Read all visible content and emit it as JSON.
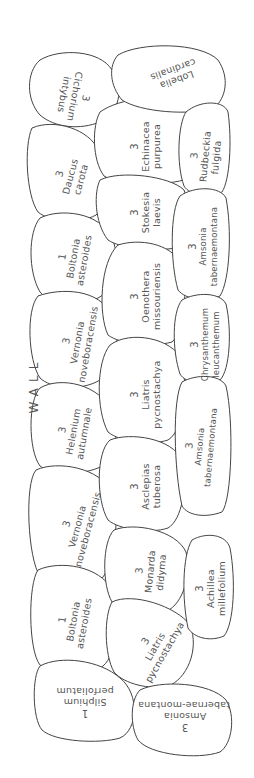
{
  "wall_label": "WALL",
  "beds": [
    {
      "id": "cichorium",
      "qty": "3",
      "name": "Cichorium",
      "name2": "intybus"
    },
    {
      "id": "lobelia",
      "qty": "",
      "name": "Lobelia",
      "name2": "cardinalis"
    },
    {
      "id": "daucus",
      "qty": "3",
      "name": "Daucus",
      "name2": "carota"
    },
    {
      "id": "echinacea",
      "qty": "3",
      "name": "Echinacea",
      "name2": "purpurea"
    },
    {
      "id": "rudbeckia",
      "qty": "3",
      "name": "Rudbeckia",
      "name2": "fulgida"
    },
    {
      "id": "stokesia",
      "qty": "3",
      "name": "Stokesia",
      "name2": "laevis"
    },
    {
      "id": "boltonia-1",
      "qty": "1",
      "name": "Boltonia",
      "name2": "asteroides"
    },
    {
      "id": "amsonia-1",
      "qty": "3",
      "name": "Amsonia",
      "name2": "tabernaemontana"
    },
    {
      "id": "oenothera",
      "qty": "3",
      "name": "Oenothera",
      "name2": "missouriensis"
    },
    {
      "id": "vernonia-1",
      "qty": "3",
      "name": "Vernonia",
      "name2": "noveboracensis"
    },
    {
      "id": "chrysanthemum",
      "qty": "3",
      "name": "Chrysanthemum",
      "name2": "leucanthemum"
    },
    {
      "id": "liatris-1",
      "qty": "3",
      "name": "Liatris",
      "name2": "pycnostachya"
    },
    {
      "id": "helenium",
      "qty": "3",
      "name": "Helenium",
      "name2": "autumnale"
    },
    {
      "id": "amsonia-2",
      "qty": "3",
      "name": "Amsonia",
      "name2": "tabernaemontana"
    },
    {
      "id": "asclepias",
      "qty": "3",
      "name": "Asclepias",
      "name2": "tuberosa"
    },
    {
      "id": "vernonia-2",
      "qty": "3",
      "name": "Vernonia",
      "name2": "noveboracensis"
    },
    {
      "id": "monarda",
      "qty": "3",
      "name": "Monarda",
      "name2": "didyma"
    },
    {
      "id": "achillea",
      "qty": "3",
      "name": "Achillea",
      "name2": "millefolium"
    },
    {
      "id": "boltonia-2",
      "qty": "1",
      "name": "Boltonia",
      "name2": "asteroides"
    },
    {
      "id": "liatris-2",
      "qty": "3",
      "name": "Liatris",
      "name2": "pycnostachya"
    },
    {
      "id": "silphium",
      "qty": "1",
      "name": "Silphium",
      "name2": "perfoliatum"
    },
    {
      "id": "amsonia-3",
      "qty": "3",
      "name": "Amsonia",
      "name2": "tabernae-montana"
    }
  ]
}
